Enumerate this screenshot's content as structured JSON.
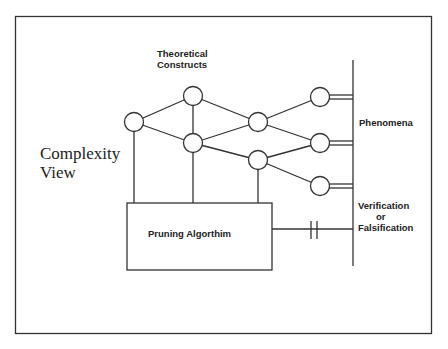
{
  "title": "Complexity View",
  "title_lines": [
    "Complexity",
    "View"
  ],
  "labels": {
    "theoretical_constructs": [
      "Theoretical",
      "Constructs"
    ],
    "phenomena": "Phenomena",
    "verification": [
      "Verification",
      "or",
      "Falsification"
    ],
    "pruning_algorithm": "Pruning Algorthim"
  },
  "nodes": [
    {
      "id": "n1",
      "cx": 134,
      "cy": 122
    },
    {
      "id": "n2",
      "cx": 193,
      "cy": 96
    },
    {
      "id": "n3",
      "cx": 193,
      "cy": 143
    },
    {
      "id": "n4",
      "cx": 258,
      "cy": 122
    },
    {
      "id": "n5",
      "cx": 258,
      "cy": 160
    },
    {
      "id": "n6",
      "cx": 320,
      "cy": 97
    },
    {
      "id": "n7",
      "cx": 320,
      "cy": 143
    },
    {
      "id": "n8",
      "cx": 320,
      "cy": 186
    }
  ],
  "edges": [
    [
      "n1",
      "n2"
    ],
    [
      "n1",
      "n3"
    ],
    [
      "n2",
      "n3"
    ],
    [
      "n2",
      "n4"
    ],
    [
      "n3",
      "n4"
    ],
    [
      "n3",
      "n5"
    ],
    [
      "n4",
      "n6"
    ],
    [
      "n4",
      "n7"
    ],
    [
      "n5",
      "n7"
    ],
    [
      "n5",
      "n8"
    ]
  ],
  "colors": {
    "line": "#333333",
    "background": "#ffffff",
    "text": "#222222"
  }
}
